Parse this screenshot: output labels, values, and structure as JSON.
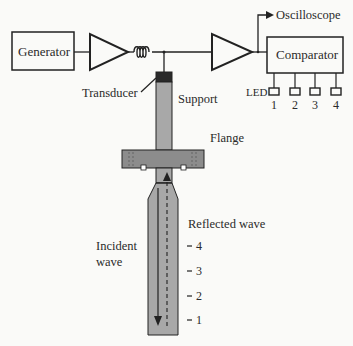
{
  "diagram": {
    "blocks": {
      "generator": "Generator",
      "comparator": "Comparator"
    },
    "labels": {
      "oscilloscope": "Oscilloscope",
      "transducer": "Transducer",
      "support": "Support",
      "flange": "Flange",
      "led": "LED",
      "reflected_wave": "Reflected wave",
      "incident_wave_line1": "Incident",
      "incident_wave_line2": "wave"
    },
    "led_numbers": [
      "1",
      "2",
      "3",
      "4"
    ],
    "position_marks": [
      "4",
      "3",
      "2",
      "1"
    ],
    "colors": {
      "line": "#222222",
      "rod_fill": "#a8a8a8",
      "transducer_fill": "#2a2a2a",
      "flange_fill": "#8c8c8c",
      "background": "#fafaf8"
    }
  }
}
